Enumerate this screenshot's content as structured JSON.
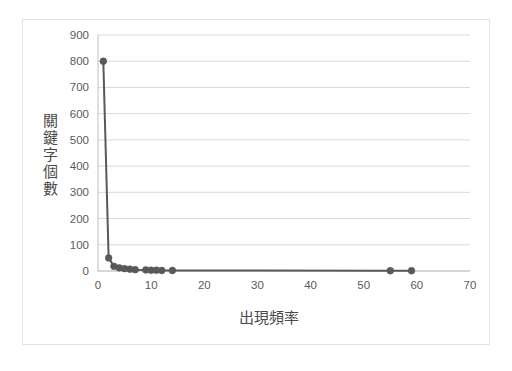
{
  "chart_data": {
    "type": "line",
    "title": "",
    "subtitle": "",
    "xlabel": "出現頻率",
    "ylabel": "關鍵字個數",
    "xlim": [
      0,
      70
    ],
    "ylim": [
      0,
      900
    ],
    "xticks": [
      0,
      10,
      20,
      30,
      40,
      50,
      60,
      70
    ],
    "yticks": [
      0,
      100,
      200,
      300,
      400,
      500,
      600,
      700,
      800,
      900
    ],
    "grid": "horizontal-only",
    "legend": "none",
    "marker": "circle",
    "series": [
      {
        "name": "關鍵字個數",
        "color": "#595959",
        "points": [
          [
            1,
            800
          ],
          [
            2,
            50
          ],
          [
            3,
            18
          ],
          [
            4,
            12
          ],
          [
            5,
            9
          ],
          [
            6,
            7
          ],
          [
            7,
            5
          ],
          [
            9,
            4
          ],
          [
            10,
            3
          ],
          [
            11,
            3
          ],
          [
            12,
            2
          ],
          [
            14,
            2
          ],
          [
            55,
            1
          ],
          [
            59,
            1
          ]
        ]
      }
    ]
  },
  "axes": {
    "y_tick_labels": [
      "900",
      "800",
      "700",
      "600",
      "500",
      "400",
      "300",
      "200",
      "100",
      "0"
    ],
    "x_tick_labels": [
      "0",
      "10",
      "20",
      "30",
      "40",
      "50",
      "60",
      "70"
    ],
    "y_title": "關鍵字個數",
    "y_title_chars": [
      "關",
      "鍵",
      "字",
      "個",
      "數"
    ],
    "x_title": "出現頻率"
  },
  "colors": {
    "series": "#595959",
    "gridline": "#d9d9d9",
    "axis_line": "#bfbfbf",
    "tick_text": "#5a5a5a",
    "title_text": "#4a4a4a",
    "card_border": "#e2e2e2",
    "background": "#ffffff"
  }
}
